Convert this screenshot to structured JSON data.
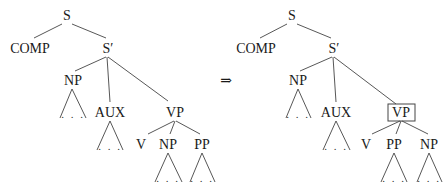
{
  "figure": {
    "arrow_symbol": "⇒",
    "ellipsis": ". . .",
    "left_tree": {
      "S": "S",
      "COMP": "COMP",
      "Sbar": "S′",
      "NP": "NP",
      "AUX": "AUX",
      "VP": "VP",
      "V": "V",
      "child2": "NP",
      "child3": "PP"
    },
    "right_tree": {
      "S": "S",
      "COMP": "COMP",
      "Sbar": "S′",
      "NP": "NP",
      "AUX": "AUX",
      "VP": "VP",
      "V": "V",
      "child2": "PP",
      "child3": "NP",
      "highlighted_node": "VP"
    }
  }
}
